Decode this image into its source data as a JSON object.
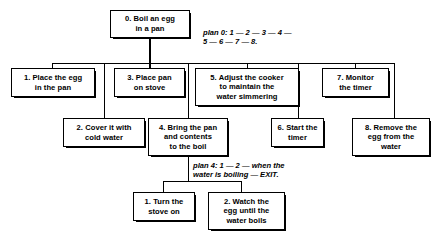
{
  "diagram": {
    "type": "hta-tree",
    "nodes": {
      "root": {
        "id": "0",
        "label": "0.  Boil an egg\nin a pan"
      },
      "task1": {
        "id": "1",
        "label": "1.  Place the egg\nin the pan"
      },
      "task2": {
        "id": "2",
        "label": "2.  Cover it with\ncold water"
      },
      "task3": {
        "id": "3",
        "label": "3.  Place pan\non stove"
      },
      "task4": {
        "id": "4",
        "label": "4.  Bring the pan\nand contents\nto the boil"
      },
      "task5": {
        "id": "5",
        "label": "5.  Adjust the cooker\nto maintain the\nwater simmering"
      },
      "task6": {
        "id": "6",
        "label": "6.  Start the\ntimer"
      },
      "task7": {
        "id": "7",
        "label": "7.  Monitor\nthe timer"
      },
      "task8": {
        "id": "8",
        "label": "8.  Remove the\negg from the\nwater"
      },
      "task4_1": {
        "id": "1",
        "label": "1.  Turn the\nstove on"
      },
      "task4_2": {
        "id": "2",
        "label": "2.  Watch the\negg until the\nwater boils"
      }
    },
    "plans": {
      "plan0": "plan 0: 1 — 2 — 3 — 4 —\n      5 — 6 — 7 — 8.",
      "plan4": "plan 4: 1 — 2 — when the\n   water is boiling — EXIT."
    },
    "colors": {
      "stroke": "#000000",
      "background": "#ffffff",
      "text": "#000000"
    }
  }
}
